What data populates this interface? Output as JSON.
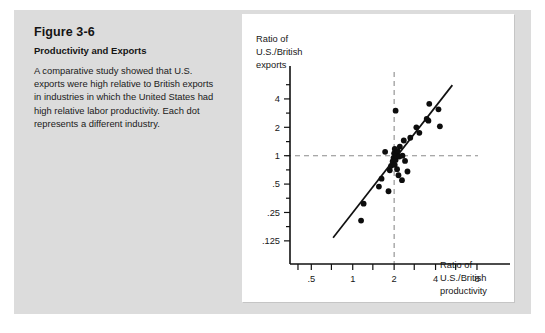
{
  "figure": {
    "number": "Figure 3-6",
    "subtitle": "Productivity and Exports",
    "description": "A comparative study showed that U.S. exports were high relative to British exports in industries in which the United States had high relative labor productivity. Each dot represents a different industry."
  },
  "colors": {
    "panel_background": "#dcdcdc",
    "card_background": "#ffffff",
    "axis": "#111111",
    "point": "#0d0d0d",
    "regression_line": "#111111",
    "dashed_reference": "#8c8c8c",
    "text": "#171717"
  },
  "chart_data": {
    "type": "scatter",
    "title": "",
    "xlabel": "Ratio of U.S./British productivity",
    "ylabel": "Ratio of U.S./British exports",
    "ylabel_lines": [
      "Ratio of",
      "U.S./British",
      "exports"
    ],
    "xlabel_lines": [
      "Ratio of",
      "U.S./British",
      "productivity"
    ],
    "xscale": "log",
    "yscale": "log",
    "xlim": [
      0.35,
      11.0
    ],
    "ylim": [
      0.1,
      7.0
    ],
    "grid": false,
    "legend": null,
    "xticks": [
      0.5,
      1,
      2,
      4,
      8
    ],
    "xtick_labels": [
      ".5",
      "1",
      "2",
      "4",
      "8"
    ],
    "yticks": [
      0.125,
      0.25,
      0.5,
      1,
      2,
      4
    ],
    "ytick_labels": [
      ".125",
      ".25",
      ".5",
      "1",
      "2",
      "4"
    ],
    "x_minor_ticks": [
      0.4,
      0.5,
      0.7,
      1,
      1.4,
      2,
      2.8,
      4,
      5.6,
      8
    ],
    "y_minor_ticks": [
      0.125,
      0.177,
      0.25,
      0.354,
      0.5,
      0.707,
      1,
      1.41,
      2,
      2.83,
      4,
      5.66
    ],
    "reference_lines": [
      {
        "orientation": "horizontal",
        "value": 1,
        "style": "dashed"
      },
      {
        "orientation": "vertical",
        "value": 2,
        "style": "dashed"
      }
    ],
    "trend_line": {
      "x": [
        0.72,
        5.3
      ],
      "y": [
        0.135,
        5.6
      ],
      "style": "solid"
    },
    "points": [
      {
        "x": 1.15,
        "y": 0.205
      },
      {
        "x": 1.2,
        "y": 0.31
      },
      {
        "x": 1.55,
        "y": 0.47
      },
      {
        "x": 1.62,
        "y": 0.57
      },
      {
        "x": 1.72,
        "y": 1.1
      },
      {
        "x": 1.82,
        "y": 0.42
      },
      {
        "x": 1.86,
        "y": 0.7
      },
      {
        "x": 1.9,
        "y": 0.78
      },
      {
        "x": 1.95,
        "y": 0.87
      },
      {
        "x": 1.98,
        "y": 0.95
      },
      {
        "x": 2.0,
        "y": 1.06
      },
      {
        "x": 2.02,
        "y": 1.18
      },
      {
        "x": 2.02,
        "y": 0.8
      },
      {
        "x": 2.05,
        "y": 0.9
      },
      {
        "x": 2.05,
        "y": 3.0
      },
      {
        "x": 2.08,
        "y": 1.0
      },
      {
        "x": 2.1,
        "y": 0.72
      },
      {
        "x": 2.12,
        "y": 1.12
      },
      {
        "x": 2.15,
        "y": 0.62
      },
      {
        "x": 2.18,
        "y": 0.98
      },
      {
        "x": 2.2,
        "y": 1.25
      },
      {
        "x": 2.28,
        "y": 0.55
      },
      {
        "x": 2.3,
        "y": 1.0
      },
      {
        "x": 2.35,
        "y": 1.45
      },
      {
        "x": 2.4,
        "y": 0.88
      },
      {
        "x": 2.5,
        "y": 0.68
      },
      {
        "x": 2.62,
        "y": 1.55
      },
      {
        "x": 2.9,
        "y": 2.0
      },
      {
        "x": 3.05,
        "y": 1.75
      },
      {
        "x": 3.45,
        "y": 2.45
      },
      {
        "x": 3.55,
        "y": 2.35
      },
      {
        "x": 3.6,
        "y": 3.55
      },
      {
        "x": 4.2,
        "y": 3.1
      },
      {
        "x": 4.3,
        "y": 2.05
      }
    ]
  }
}
